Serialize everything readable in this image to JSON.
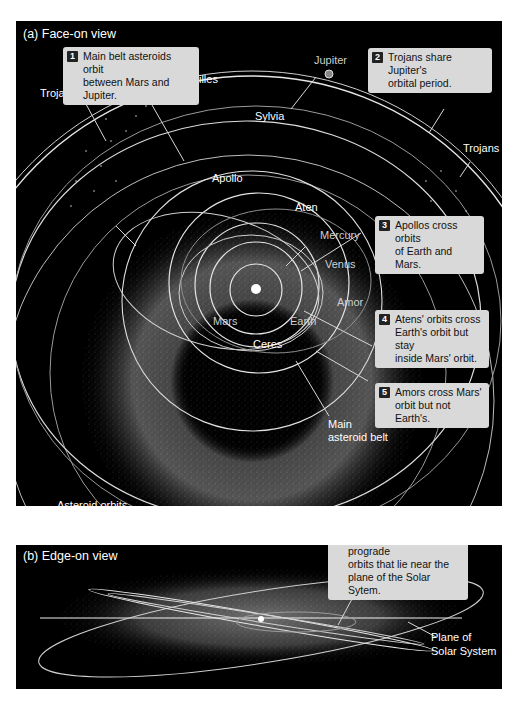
{
  "panel_a": {
    "title": "(a)  Face-on view",
    "labels": {
      "trojans_left": "Trojans",
      "trojans_right": "Trojans",
      "jupiter": "Jupiter",
      "jupiters_orbit": "Jupiter's orbit",
      "achilles": "Achilles",
      "sylvia": "Sylvia",
      "apollo": "Apollo",
      "aten": "Aten",
      "mercury": "Mercury",
      "venus": "Venus",
      "amor": "Amor",
      "mars": "Mars",
      "earth": "Earth",
      "ceres": "Ceres",
      "main_belt": "Main\nasteroid belt",
      "asteroid_orbits": "Asteroid orbits"
    },
    "callouts": [
      {
        "num": "1",
        "text": "Main belt asteroids orbit\nbetween Mars and Jupiter."
      },
      {
        "num": "2",
        "text": "Trojans share Jupiter's\norbital period."
      },
      {
        "num": "3",
        "text": "Apollos cross orbits\nof Earth and Mars."
      },
      {
        "num": "4",
        "text": "Atens' orbits cross\nEarth's orbit but stay\ninside Mars' orbit."
      },
      {
        "num": "5",
        "text": "Amors cross Mars'\norbit but not Earth's."
      }
    ]
  },
  "panel_b": {
    "title": "(b)  Edge-on view",
    "labels": {
      "plane": "Plane of\nSolar System"
    },
    "callouts": [
      {
        "num": "6",
        "text": "Asteroids follow prograde\norbits that lie near the\nplane of the Solar Sytem."
      }
    ]
  },
  "colors": {
    "background": "#000000",
    "orbit_line": "#e6e6e6",
    "callout_bg": "#d9d9d9",
    "belt_dots": "#bdbdbd"
  }
}
